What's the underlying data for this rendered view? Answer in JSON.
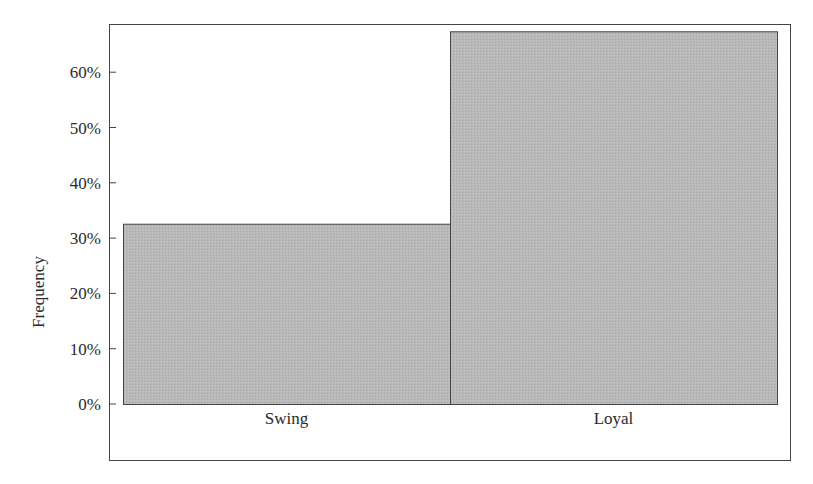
{
  "chart_data": {
    "type": "bar",
    "title": "",
    "xlabel": "",
    "ylabel": "Frequency",
    "categories": [
      "Swing",
      "Loyal"
    ],
    "values": [
      32.6,
      67.4
    ],
    "value_unit": "%",
    "ylim": [
      0,
      70
    ],
    "yticks": [
      0,
      10,
      20,
      30,
      40,
      50,
      60
    ],
    "ytick_labels": [
      "0%",
      "10%",
      "20%",
      "30%",
      "40%",
      "50%",
      "60%"
    ],
    "grid": false,
    "legend": null,
    "bar_color": "#b4b4b4",
    "bar_edge_color": "#444444"
  }
}
